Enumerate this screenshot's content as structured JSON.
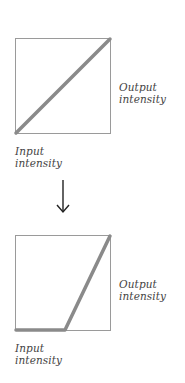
{
  "diagram": {
    "top_panel": {
      "curve_name": "identity",
      "x_label": "Input\nintensity",
      "y_label": "Output\nintensity",
      "curve_points": [
        [
          0,
          0
        ],
        [
          1,
          1
        ]
      ]
    },
    "transition": {
      "icon": "down-arrow-icon"
    },
    "bottom_panel": {
      "curve_name": "threshold-ramp",
      "x_label": "Input\nintensity",
      "y_label": "Output\nintensity",
      "curve_points": [
        [
          0,
          0
        ],
        [
          0.52,
          0
        ],
        [
          1,
          1
        ]
      ]
    },
    "colors": {
      "box_border": "#9a9a9a",
      "curve": "#8a8a8a",
      "text": "#444444",
      "arrow": "#222222"
    }
  }
}
